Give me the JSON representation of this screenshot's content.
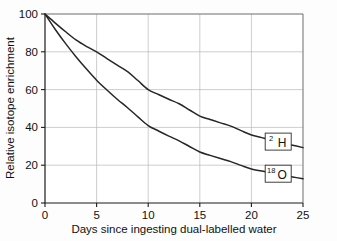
{
  "chart_data": {
    "type": "line",
    "title": "",
    "xlabel": "Days since ingesting dual-labelled water",
    "ylabel": "Relative isotope enrichment",
    "xlim": [
      0,
      25
    ],
    "ylim": [
      0,
      100
    ],
    "xticks": [
      "0",
      "5",
      "10",
      "15",
      "20",
      "25"
    ],
    "yticks": [
      "0",
      "20",
      "40",
      "60",
      "80",
      "100"
    ],
    "grid": true,
    "legend_position": "inline-right-end-labels",
    "x": [
      0,
      1,
      2,
      3,
      4,
      5,
      6,
      7,
      8,
      9,
      10,
      11,
      12,
      13,
      14,
      15,
      16,
      17,
      18,
      19,
      20,
      21,
      22,
      23,
      24,
      25
    ],
    "series": [
      {
        "name": "2H",
        "label_main": "H",
        "label_sup": "2",
        "values": [
          100,
          95.2,
          90.6,
          86.3,
          82.9,
          80.0,
          76.4,
          72.9,
          69.5,
          64.8,
          60.0,
          57.4,
          54.9,
          52.5,
          49.2,
          46.0,
          44.2,
          42.4,
          40.7,
          38.3,
          36.0,
          34.6,
          33.2,
          31.9,
          30.6,
          29.3
        ]
      },
      {
        "name": "18O",
        "label_main": "O",
        "label_sup": "18",
        "values": [
          100,
          91.8,
          84.3,
          77.4,
          71.0,
          65.0,
          59.8,
          54.9,
          50.4,
          45.6,
          41.0,
          38.1,
          35.4,
          32.9,
          29.9,
          27.0,
          25.2,
          23.5,
          21.9,
          19.9,
          18.0,
          16.9,
          15.8,
          14.8,
          13.8,
          12.8
        ]
      }
    ],
    "annotations": [
      {
        "series": "2H",
        "x": 22.6,
        "y": 32.5
      },
      {
        "series": "18O",
        "x": 22.6,
        "y": 15.5
      }
    ],
    "colors": {
      "curve": "#262626",
      "grid": "#b9b9b9",
      "axis": "#1a1a1a",
      "background": "#fdfdfd"
    }
  }
}
